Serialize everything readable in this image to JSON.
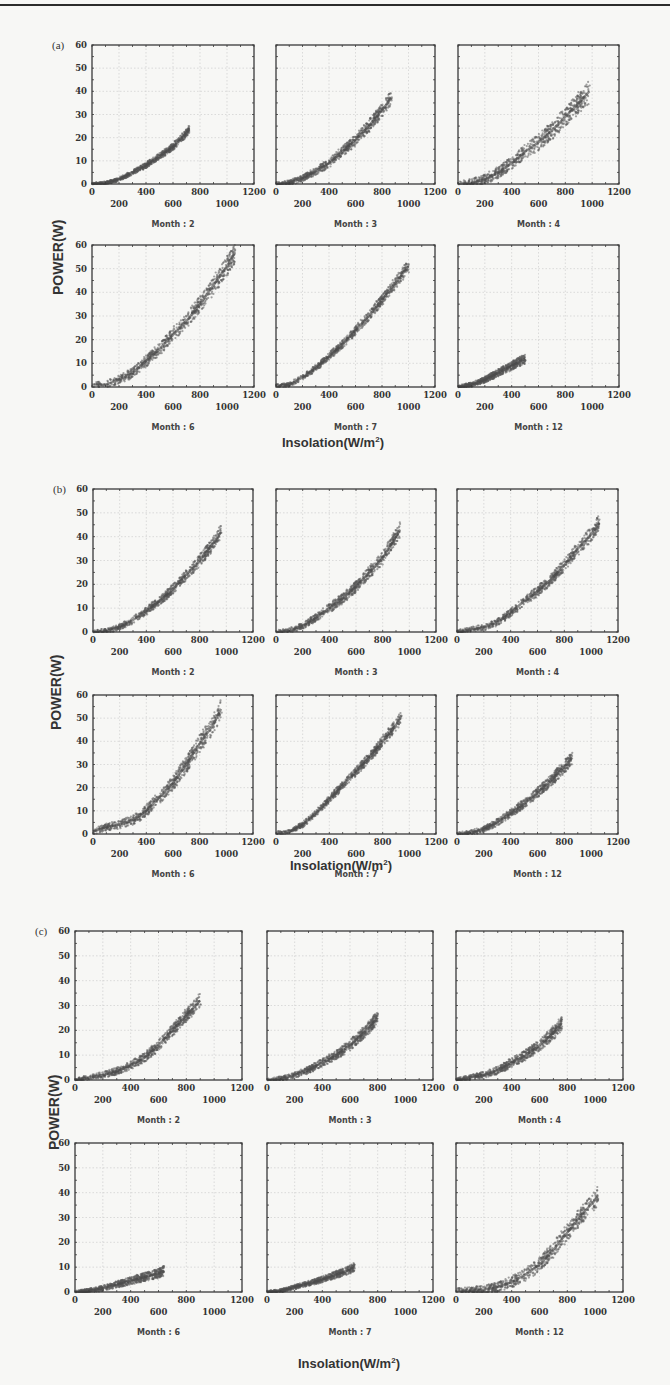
{
  "figure": {
    "y_axis_label": "POWER(W)",
    "x_axis_label_text": "Insolation(W/m",
    "x_axis_label_sup": "2",
    "x_axis_label_close": ")",
    "y_ticks": [
      "0",
      "10",
      "20",
      "30",
      "40",
      "50",
      "60"
    ],
    "x_ticks_upper": [
      "0",
      "400",
      "800",
      "1200"
    ],
    "x_ticks_lower": [
      "200",
      "600",
      "1000"
    ],
    "colors": {
      "scatter": "#5a5a5a",
      "frame": "#3a3a3a",
      "grid": "#c8c8c8",
      "background": "#f7f7f5"
    }
  },
  "sections": [
    {
      "label": "(a)",
      "xlabel_pos": [
        282,
        445
      ],
      "ylabel_pos": [
        50,
        295
      ],
      "rows": [
        {
          "top": 45,
          "bottom": 184,
          "month_y": 192
        },
        {
          "top": 245,
          "bottom": 387,
          "month_y": 430
        }
      ],
      "cols": [
        [
          92,
          254
        ],
        [
          276,
          435
        ],
        [
          458,
          619
        ]
      ]
    },
    {
      "label": "(b)",
      "xlabel_pos": [
        290,
        868
      ],
      "ylabel_pos": [
        48,
        730
      ],
      "rows": [
        {
          "top": 489,
          "bottom": 632,
          "month_y": 672
        },
        {
          "top": 695,
          "bottom": 834,
          "month_y": 876
        }
      ],
      "cols": [
        [
          93,
          253
        ],
        [
          276,
          436
        ],
        [
          457,
          618
        ]
      ]
    },
    {
      "label": "(c)",
      "xlabel_pos": [
        298,
        1366
      ],
      "ylabel_pos": [
        46,
        1150
      ],
      "rows": [
        {
          "top": 931,
          "bottom": 1080,
          "month_y": 1114
        },
        {
          "top": 1143,
          "bottom": 1292,
          "month_y": 1333
        }
      ],
      "cols": [
        [
          75,
          242
        ],
        [
          267,
          433
        ],
        [
          456,
          623
        ]
      ]
    }
  ],
  "chart_data": [
    {
      "type": "scatter",
      "title": "(a)",
      "xlabel": "Insolation(W/m²)",
      "ylabel": "POWER(W)",
      "xlim": [
        0,
        1200
      ],
      "ylim": [
        0,
        60
      ],
      "grid": true,
      "panels": [
        {
          "month_label": "Month : 2",
          "x": [
            0,
            100,
            200,
            300,
            400,
            500,
            600,
            700,
            720
          ],
          "y": [
            0,
            0.5,
            2,
            5,
            8,
            12,
            16,
            22,
            24
          ],
          "spread": 1.2
        },
        {
          "month_label": "Month : 3",
          "x": [
            0,
            100,
            200,
            300,
            400,
            500,
            600,
            700,
            800,
            870
          ],
          "y": [
            0,
            0.5,
            2.5,
            5.5,
            9,
            14,
            19,
            25,
            32,
            37
          ],
          "spread": 2.2
        },
        {
          "month_label": "Month : 4",
          "x": [
            0,
            100,
            200,
            300,
            400,
            500,
            600,
            700,
            800,
            900,
            980
          ],
          "y": [
            0,
            0.5,
            2,
            5,
            9,
            14,
            18,
            23,
            29,
            35,
            40
          ],
          "spread": 3.5
        },
        {
          "month_label": "Month : 6",
          "x": [
            0,
            100,
            200,
            300,
            400,
            500,
            600,
            700,
            800,
            900,
            1000,
            1060
          ],
          "y": [
            1,
            1,
            3,
            6,
            11,
            16,
            22,
            28,
            35,
            43,
            51,
            57
          ],
          "spread": 3
        },
        {
          "month_label": "Month : 7",
          "x": [
            0,
            100,
            200,
            300,
            400,
            500,
            600,
            700,
            800,
            900,
            1000
          ],
          "y": [
            0.5,
            1,
            4,
            8,
            13,
            18,
            24,
            30,
            37,
            44,
            51
          ],
          "spread": 1.8
        },
        {
          "month_label": "Month : 12",
          "x": [
            0,
            100,
            200,
            300,
            400,
            500
          ],
          "y": [
            0,
            1,
            3,
            6,
            9,
            12
          ],
          "spread": 1.5
        }
      ]
    },
    {
      "type": "scatter",
      "title": "(b)",
      "xlabel": "Insolation(W/m²)",
      "ylabel": "POWER(W)",
      "xlim": [
        0,
        1200
      ],
      "ylim": [
        0,
        60
      ],
      "grid": true,
      "panels": [
        {
          "month_label": "Month : 2",
          "x": [
            0,
            100,
            200,
            300,
            400,
            500,
            600,
            700,
            800,
            900,
            960
          ],
          "y": [
            0,
            0.5,
            2,
            5,
            9,
            13,
            18,
            24,
            30,
            37,
            42
          ],
          "spread": 2
        },
        {
          "month_label": "Month : 3",
          "x": [
            0,
            100,
            200,
            300,
            400,
            500,
            600,
            700,
            800,
            900,
            930
          ],
          "y": [
            0,
            0.5,
            2.5,
            6,
            10,
            14,
            19,
            25,
            31,
            40,
            43
          ],
          "spread": 2.2
        },
        {
          "month_label": "Month : 4",
          "x": [
            0,
            100,
            200,
            300,
            400,
            500,
            600,
            700,
            800,
            900,
            1000,
            1060
          ],
          "y": [
            0,
            1,
            2,
            4,
            8,
            13,
            17,
            22,
            28,
            35,
            41,
            46
          ],
          "spread": 2.2
        },
        {
          "month_label": "Month : 6",
          "x": [
            0,
            100,
            200,
            300,
            400,
            500,
            600,
            700,
            800,
            900,
            960
          ],
          "y": [
            1,
            3,
            4,
            6,
            10,
            16,
            22,
            30,
            39,
            47,
            54
          ],
          "spread": 3
        },
        {
          "month_label": "Month : 7",
          "x": [
            0,
            100,
            200,
            300,
            400,
            500,
            600,
            700,
            800,
            900,
            940
          ],
          "y": [
            0.5,
            1,
            4,
            9,
            15,
            21,
            27,
            33,
            40,
            47,
            51
          ],
          "spread": 1.8
        },
        {
          "month_label": "Month : 12",
          "x": [
            0,
            100,
            200,
            300,
            400,
            500,
            600,
            700,
            800,
            860
          ],
          "y": [
            0,
            0.5,
            2,
            5,
            9,
            13,
            18,
            23,
            29,
            33
          ],
          "spread": 2
        }
      ]
    },
    {
      "type": "scatter",
      "title": "(c)",
      "xlabel": "Insolation(W/m²)",
      "ylabel": "POWER(W)",
      "xlim": [
        0,
        1200
      ],
      "ylim": [
        0,
        60
      ],
      "grid": true,
      "panels": [
        {
          "month_label": "Month : 2",
          "x": [
            0,
            100,
            200,
            300,
            400,
            500,
            600,
            700,
            800,
            900
          ],
          "y": [
            0,
            1,
            2,
            3.5,
            6,
            9,
            14,
            20,
            26,
            32
          ],
          "spread": 2
        },
        {
          "month_label": "Month : 3",
          "x": [
            0,
            100,
            200,
            300,
            400,
            500,
            600,
            700,
            800
          ],
          "y": [
            0,
            0.5,
            2,
            4,
            7,
            10,
            14,
            19,
            25
          ],
          "spread": 1.8
        },
        {
          "month_label": "Month : 4",
          "x": [
            0,
            100,
            200,
            300,
            400,
            500,
            600,
            700,
            760
          ],
          "y": [
            0,
            1,
            2,
            4,
            7,
            10,
            14,
            19,
            23
          ],
          "spread": 2
        },
        {
          "month_label": "Month : 6",
          "x": [
            0,
            100,
            200,
            300,
            400,
            500,
            600,
            640
          ],
          "y": [
            0,
            0.5,
            1.5,
            3,
            4.5,
            6,
            7.5,
            8.5
          ],
          "spread": 1.5
        },
        {
          "month_label": "Month : 7",
          "x": [
            0,
            100,
            200,
            300,
            400,
            500,
            600,
            630
          ],
          "y": [
            0,
            0.5,
            2,
            3.5,
            5,
            7,
            9,
            10
          ],
          "spread": 1.2
        },
        {
          "month_label": "Month : 12",
          "x": [
            0,
            100,
            200,
            300,
            400,
            500,
            600,
            700,
            800,
            900,
            1000,
            1020
          ],
          "y": [
            0.5,
            0.5,
            1,
            2,
            4,
            7,
            11,
            17,
            24,
            31,
            37,
            39
          ],
          "spread": 2.8
        }
      ]
    }
  ]
}
